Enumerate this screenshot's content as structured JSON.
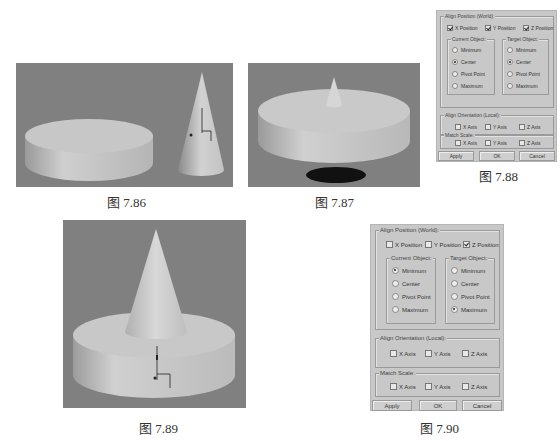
{
  "figures": [
    {
      "id": "7.86",
      "caption": "图 7.86",
      "description": "flat cylinder and cone side by side, cone with pivot gizmo"
    },
    {
      "id": "7.87",
      "caption": "图 7.87",
      "description": "small cone centered on top of cylinder, shadow beneath"
    },
    {
      "id": "7.88",
      "caption": "图 7.88",
      "description": "Align Selection dialog"
    },
    {
      "id": "7.89",
      "caption": "图 7.89",
      "description": "cone sitting on top of cylinder with pivot gizmo"
    },
    {
      "id": "7.90",
      "caption": "图 7.90",
      "description": "Align Selection dialog"
    }
  ],
  "colors": {
    "viewport_bg": "#7f7f7f",
    "object": "#c9c9c9",
    "dialog_bg": "#c8c8c8"
  },
  "dialog_788": {
    "align_position_label": "Align Position (World):",
    "axes": [
      {
        "label": "X Position",
        "checked": true
      },
      {
        "label": "Y Position",
        "checked": true
      },
      {
        "label": "Z Position",
        "checked": true
      }
    ],
    "current_object_label": "Current Object:",
    "target_object_label": "Target Object:",
    "current_options": [
      {
        "label": "Minimum",
        "selected": false
      },
      {
        "label": "Center",
        "selected": true
      },
      {
        "label": "Pivot Point",
        "selected": false
      },
      {
        "label": "Maximum",
        "selected": false
      }
    ],
    "target_options": [
      {
        "label": "Minimum",
        "selected": false
      },
      {
        "label": "Center",
        "selected": true
      },
      {
        "label": "Pivot Point",
        "selected": false
      },
      {
        "label": "Maximum",
        "selected": false
      }
    ],
    "align_orientation_label": "Align Orientation (Local):",
    "orientation_axes": [
      {
        "label": "X Axis",
        "checked": false
      },
      {
        "label": "Y Axis",
        "checked": false
      },
      {
        "label": "Z Axis",
        "checked": false
      }
    ],
    "match_scale_label": "Match Scale:",
    "scale_axes": [
      {
        "label": "X Axis",
        "checked": false
      },
      {
        "label": "Y Axis",
        "checked": false
      },
      {
        "label": "Z Axis",
        "checked": false
      }
    ],
    "apply_label": "Apply",
    "ok_label": "OK",
    "cancel_label": "Cancel"
  },
  "dialog_790": {
    "align_position_label": "Align Position (World):",
    "axes": [
      {
        "label": "X Position",
        "checked": false
      },
      {
        "label": "Y Position",
        "checked": false
      },
      {
        "label": "Z Position",
        "checked": true
      }
    ],
    "current_object_label": "Current Object:",
    "target_object_label": "Target Object:",
    "current_options": [
      {
        "label": "Minimum",
        "selected": true
      },
      {
        "label": "Center",
        "selected": false
      },
      {
        "label": "Pivot Point",
        "selected": false
      },
      {
        "label": "Maximum",
        "selected": false
      }
    ],
    "target_options": [
      {
        "label": "Minimum",
        "selected": false
      },
      {
        "label": "Center",
        "selected": false
      },
      {
        "label": "Pivot Point",
        "selected": false
      },
      {
        "label": "Maximum",
        "selected": true
      }
    ],
    "align_orientation_label": "Align Orientation (Local):",
    "orientation_axes": [
      {
        "label": "X Axis",
        "checked": false
      },
      {
        "label": "Y Axis",
        "checked": false
      },
      {
        "label": "Z Axis",
        "checked": false
      }
    ],
    "match_scale_label": "Match Scale:",
    "scale_axes": [
      {
        "label": "X Axis",
        "checked": false
      },
      {
        "label": "Y Axis",
        "checked": false
      },
      {
        "label": "Z Axis",
        "checked": false
      }
    ],
    "apply_label": "Apply",
    "ok_label": "OK",
    "cancel_label": "Cancel"
  }
}
